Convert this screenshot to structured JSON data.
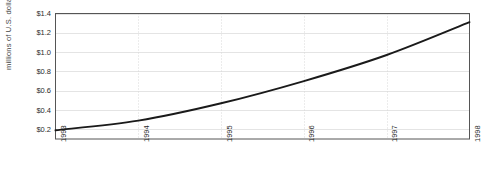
{
  "chart_data": {
    "type": "line",
    "title": "",
    "xlabel": "",
    "ylabel": "millions of U.S. dollars",
    "x": [
      1993,
      1994,
      1995,
      1996,
      1997,
      1998
    ],
    "categories": [
      "1993",
      "1994",
      "1995",
      "1996",
      "1997",
      "1998"
    ],
    "values": [
      0.19,
      0.29,
      0.47,
      0.7,
      0.97,
      1.31
    ],
    "series": [
      {
        "name": "",
        "values": [
          0.19,
          0.29,
          0.47,
          0.7,
          0.97,
          1.31
        ]
      }
    ],
    "xlim": [
      1993,
      1998
    ],
    "ylim": [
      0.1,
      1.4
    ],
    "y_ticks": [
      0.2,
      0.4,
      0.6,
      0.8,
      1.0,
      1.2,
      1.4
    ],
    "y_tick_labels": [
      "$0.2",
      "$0.4",
      "$0.6",
      "$0.8",
      "$1.0",
      "$1.2",
      "$1.4"
    ],
    "x_tick_labels": [
      "1993",
      "1994",
      "1995",
      "1996",
      "1997",
      "1998"
    ],
    "grid": {
      "horizontal": true,
      "vertical": true
    },
    "legend": {
      "visible": false,
      "position": "none"
    },
    "colors": {
      "line": "#1a1a1a",
      "horizontal_gridline": "#e4e4e4",
      "vertical_gridline": "#d8d8d8",
      "axis_border": "#555555",
      "background": "#ffffff",
      "tick_text": "#2b2b2b",
      "axis_title_text": "#444444"
    }
  }
}
